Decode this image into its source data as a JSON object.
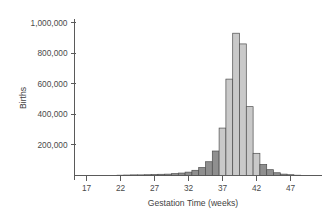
{
  "chart_data": {
    "type": "bar",
    "title": "",
    "xlabel": "Gestation Time (weeks)",
    "ylabel": "Births",
    "xlim": [
      15,
      49
    ],
    "ylim": [
      0,
      1050000
    ],
    "grid": false,
    "legend": null,
    "x_ticks": [
      "17",
      "22",
      "27",
      "32",
      "37",
      "42",
      "47"
    ],
    "x_tick_values": [
      17,
      22,
      27,
      32,
      37,
      42,
      47
    ],
    "y_ticks": [
      "200,000",
      "400,000",
      "600,000",
      "800,000",
      "1,000,000"
    ],
    "y_tick_values": [
      200000,
      400000,
      600000,
      800000,
      1000000
    ],
    "bar_width_weeks": 1,
    "colors": {
      "preterm_postterm": "#8f8f8f",
      "term": "#c9c9c9",
      "bar_edge": "#4d4d4d",
      "axis": "#5a5a5a",
      "text": "#3f3f3f",
      "background": "#ffffff"
    },
    "categories": [
      17,
      18,
      19,
      20,
      21,
      22,
      23,
      24,
      25,
      26,
      27,
      28,
      29,
      30,
      31,
      32,
      33,
      34,
      35,
      36,
      37,
      38,
      39,
      40,
      41,
      42,
      43,
      44,
      45,
      46,
      47,
      48
    ],
    "values": [
      0,
      0,
      0,
      0,
      0,
      2000,
      3000,
      4000,
      4000,
      5000,
      6000,
      8000,
      9000,
      12000,
      16000,
      22000,
      34000,
      52000,
      90000,
      160000,
      310000,
      630000,
      930000,
      860000,
      450000,
      145000,
      72000,
      38000,
      18000,
      9000,
      5000,
      2000
    ],
    "bar_groups": [
      {
        "name": "pre-term",
        "weeks": [
          17,
          36
        ],
        "color": "#8f8f8f"
      },
      {
        "name": "term",
        "weeks": [
          37,
          42
        ],
        "color": "#c9c9c9"
      },
      {
        "name": "post-term",
        "weeks": [
          43,
          48
        ],
        "color": "#8f8f8f"
      }
    ],
    "bars": [
      {
        "week": 17,
        "value": 0,
        "shade": "dark"
      },
      {
        "week": 18,
        "value": 0,
        "shade": "dark"
      },
      {
        "week": 19,
        "value": 0,
        "shade": "dark"
      },
      {
        "week": 20,
        "value": 0,
        "shade": "dark"
      },
      {
        "week": 21,
        "value": 0,
        "shade": "dark"
      },
      {
        "week": 22,
        "value": 2000,
        "shade": "dark"
      },
      {
        "week": 23,
        "value": 3000,
        "shade": "dark"
      },
      {
        "week": 24,
        "value": 4000,
        "shade": "dark"
      },
      {
        "week": 25,
        "value": 4000,
        "shade": "dark"
      },
      {
        "week": 26,
        "value": 5000,
        "shade": "dark"
      },
      {
        "week": 27,
        "value": 6000,
        "shade": "dark"
      },
      {
        "week": 28,
        "value": 8000,
        "shade": "dark"
      },
      {
        "week": 29,
        "value": 9000,
        "shade": "dark"
      },
      {
        "week": 30,
        "value": 12000,
        "shade": "dark"
      },
      {
        "week": 31,
        "value": 16000,
        "shade": "dark"
      },
      {
        "week": 32,
        "value": 22000,
        "shade": "dark"
      },
      {
        "week": 33,
        "value": 34000,
        "shade": "dark"
      },
      {
        "week": 34,
        "value": 52000,
        "shade": "dark"
      },
      {
        "week": 35,
        "value": 90000,
        "shade": "dark"
      },
      {
        "week": 36,
        "value": 160000,
        "shade": "dark"
      },
      {
        "week": 37,
        "value": 310000,
        "shade": "light"
      },
      {
        "week": 38,
        "value": 630000,
        "shade": "light"
      },
      {
        "week": 39,
        "value": 930000,
        "shade": "light"
      },
      {
        "week": 40,
        "value": 860000,
        "shade": "light"
      },
      {
        "week": 41,
        "value": 450000,
        "shade": "light"
      },
      {
        "week": 42,
        "value": 145000,
        "shade": "light"
      },
      {
        "week": 43,
        "value": 72000,
        "shade": "dark"
      },
      {
        "week": 44,
        "value": 38000,
        "shade": "dark"
      },
      {
        "week": 45,
        "value": 18000,
        "shade": "dark"
      },
      {
        "week": 46,
        "value": 9000,
        "shade": "dark"
      },
      {
        "week": 47,
        "value": 5000,
        "shade": "dark"
      },
      {
        "week": 48,
        "value": 2000,
        "shade": "dark"
      }
    ]
  }
}
